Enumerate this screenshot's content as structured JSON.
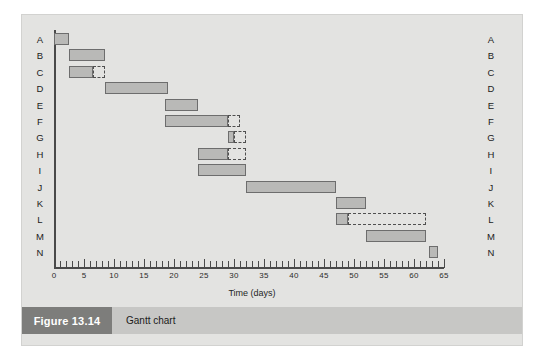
{
  "figure": {
    "number": "Figure 13.14",
    "title": "Gantt chart"
  },
  "colors": {
    "panel_background": "#e3e3e1",
    "bar_fill": "#b9b9b7",
    "bar_border": "#6d6d6d",
    "float_border": "#4f4f4f",
    "axis": "#4a4a4a",
    "caption_block": "#7d7d7b",
    "caption_bar": "#c7c7c5"
  },
  "chart_data": {
    "type": "bar",
    "chart_kind": "gantt",
    "title": "Gantt chart",
    "xlabel": "Time (days)",
    "ylabel": "",
    "xlim": [
      0,
      65
    ],
    "x_major_step": 5,
    "x_minor_step": 1,
    "grid": false,
    "legend": null,
    "x_tick_labels": [
      "0",
      "5",
      "10",
      "15",
      "20",
      "25",
      "30",
      "35",
      "40",
      "45",
      "50",
      "55",
      "60",
      "65"
    ],
    "x_tick_values": [
      0,
      5,
      10,
      15,
      20,
      25,
      30,
      35,
      40,
      45,
      50,
      55,
      60,
      65
    ],
    "categories": [
      "A",
      "B",
      "C",
      "D",
      "E",
      "F",
      "G",
      "H",
      "I",
      "J",
      "K",
      "L",
      "M",
      "N"
    ],
    "y_labels_left": [
      "A",
      "B",
      "C",
      "D",
      "E",
      "F",
      "G",
      "H",
      "I",
      "J",
      "K",
      "L",
      "M",
      "N"
    ],
    "y_labels_right": [
      "A",
      "B",
      "C",
      "D",
      "E",
      "F",
      "G",
      "H",
      "I",
      "J",
      "K",
      "L",
      "M",
      "N"
    ],
    "tasks": [
      {
        "label": "A",
        "start": 0,
        "end": 2.5,
        "duration": 2.5,
        "float_end": null
      },
      {
        "label": "B",
        "start": 2.5,
        "end": 8.5,
        "duration": 6,
        "float_end": null
      },
      {
        "label": "C",
        "start": 2.5,
        "end": 6.5,
        "duration": 4,
        "float_end": 8.5
      },
      {
        "label": "D",
        "start": 8.5,
        "end": 19,
        "duration": 10.5,
        "float_end": null
      },
      {
        "label": "E",
        "start": 18.5,
        "end": 24,
        "duration": 5.5,
        "float_end": null
      },
      {
        "label": "F",
        "start": 18.5,
        "end": 29,
        "duration": 10.5,
        "float_end": 31
      },
      {
        "label": "G",
        "start": 29,
        "end": 30,
        "duration": 1,
        "float_end": 32
      },
      {
        "label": "H",
        "start": 24,
        "end": 29,
        "duration": 5,
        "float_end": 32
      },
      {
        "label": "I",
        "start": 24,
        "end": 32,
        "duration": 8,
        "float_end": null
      },
      {
        "label": "J",
        "start": 32,
        "end": 47,
        "duration": 15,
        "float_end": null
      },
      {
        "label": "K",
        "start": 47,
        "end": 52,
        "duration": 5,
        "float_end": null
      },
      {
        "label": "L",
        "start": 47,
        "end": 49,
        "duration": 2,
        "float_end": 62
      },
      {
        "label": "M",
        "start": 52,
        "end": 62,
        "duration": 10,
        "float_end": null
      },
      {
        "label": "N",
        "start": 62.5,
        "end": 64,
        "duration": 1.5,
        "float_end": null
      }
    ]
  }
}
